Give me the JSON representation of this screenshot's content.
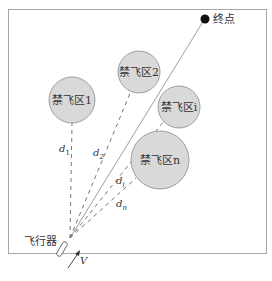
{
  "diagram": {
    "destination_label": "终点",
    "aircraft_label": "飞行器",
    "velocity_label": "V",
    "zones": [
      {
        "label": "禁飞区1",
        "cx": 72,
        "cy": 100,
        "r": 23
      },
      {
        "label": "禁飞区2",
        "cx": 139,
        "cy": 72,
        "r": 21
      },
      {
        "label": "禁飞区i",
        "cx": 179,
        "cy": 107,
        "r": 21
      },
      {
        "label": "禁飞区n",
        "cx": 160,
        "cy": 160,
        "r": 29
      }
    ],
    "distances": [
      {
        "label": "d1",
        "main": "d",
        "sub": "1"
      },
      {
        "label": "d2",
        "main": "d",
        "sub": "2"
      },
      {
        "label": "di",
        "main": "d",
        "sub": "i"
      },
      {
        "label": "dn",
        "main": "d",
        "sub": "n"
      }
    ],
    "colors": {
      "zone_fill": "#d9d9d9",
      "zone_stroke": "#8c8c8c",
      "frame": "#a6a6a6",
      "line": "#777777",
      "endpoint": "#111111"
    }
  },
  "caption": ""
}
